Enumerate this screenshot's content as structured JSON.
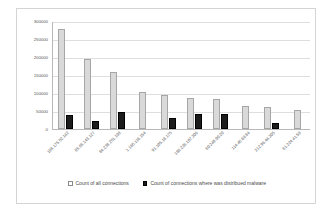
{
  "chart_data": {
    "type": "bar",
    "title": "",
    "xlabel": "",
    "ylabel": "",
    "ylim": [
      0,
      300000
    ],
    "ytick_step": 50000,
    "yticks": [
      "300000",
      "250000",
      "200000",
      "150000",
      "100000",
      "50000",
      "0"
    ],
    "grid": true,
    "legend_position": "bottom",
    "categories": [
      "188.175.52.142",
      "85.65.143.127",
      "84.238.251.198",
      "1.165.116.154",
      "91.105.18.175",
      "188.226.107.206",
      "60.249.90.20",
      "114.46.68.84",
      "212.96.44.205",
      "61.224.41.58"
    ],
    "series": [
      {
        "name": "Count of all connections",
        "color": "#d9d9d9",
        "values": [
          278000,
          195000,
          159000,
          103000,
          95000,
          86000,
          84000,
          65000,
          60000,
          54000
        ]
      },
      {
        "name": "Count of connections where was distribued malware",
        "color": "#1c1c1c",
        "values": [
          38000,
          21000,
          46000,
          0,
          31000,
          41000,
          42000,
          0,
          17000,
          0
        ]
      }
    ]
  }
}
